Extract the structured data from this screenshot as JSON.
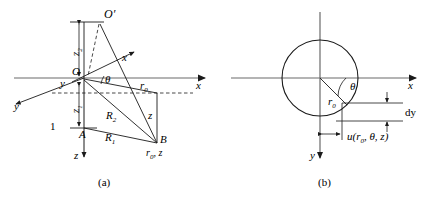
{
  "figure": {
    "type": "technical-line-diagram",
    "panels": [
      {
        "caption": "(a)",
        "description": "3D cylindrical coordinate construction with source point O', field points A and B",
        "labels": {
          "o_prime": "O′",
          "origin": "O",
          "axis_x_outer": "x",
          "axis_x_inner": "x",
          "axis_y_outer": "y",
          "axis_y_inner": "y",
          "axis_z": "z",
          "theta": "θ",
          "r0": "r",
          "r0_sub": "0",
          "point_a": "A",
          "point_b": "B",
          "b_coords_main": "r",
          "b_coords_sub": "0",
          "b_coords_tail": ", z",
          "R1": "R",
          "R1_sub": "1",
          "R2": "R",
          "R2_sub": "2",
          "depth_z": "z",
          "tick_one": "1",
          "vert_upper_main": "z",
          "vert_upper_sub": "2",
          "vert_lower_main": "z",
          "vert_lower_sub": "1"
        }
      },
      {
        "caption": "(b)",
        "description": "Cross-section: circle of radius r0 with radial displacement u and increment dy",
        "labels": {
          "axis_x": "x",
          "axis_y": "y",
          "theta": "θ",
          "r0": "r",
          "r0_sub": "0",
          "dy": "dy",
          "u_func": "u(r",
          "u_func_sub": "0",
          "u_func_tail": ", θ, z)"
        }
      }
    ]
  },
  "colors": {
    "stroke": "#1a1a1a",
    "axis": "#555555",
    "background": "#ffffff",
    "text": "#000000"
  }
}
